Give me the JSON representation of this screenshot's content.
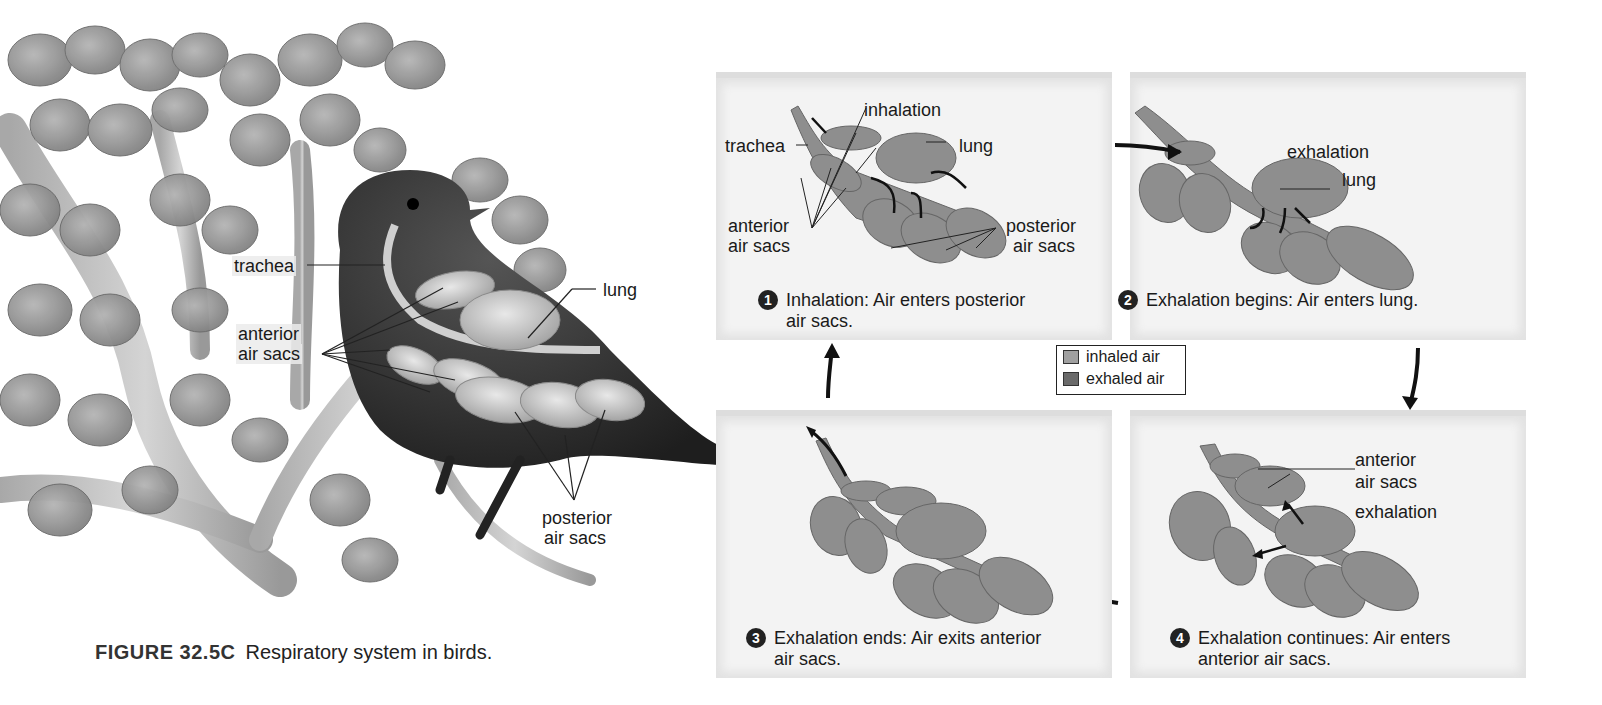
{
  "figure": {
    "number": "FIGURE 32.5C",
    "title": "Respiratory system in birds."
  },
  "bird_illustration": {
    "labels": {
      "trachea": "trachea",
      "lung": "lung",
      "anterior_line1": "anterior",
      "anterior_line2": "air sacs",
      "posterior_line1": "posterior",
      "posterior_line2": "air sacs"
    }
  },
  "legend": {
    "items": [
      {
        "label": "inhaled air",
        "color": "#a0a0a0"
      },
      {
        "label": "exhaled air",
        "color": "#6a6a6a"
      }
    ]
  },
  "panels": [
    {
      "step": "1",
      "caption_line1": "Inhalation: Air enters posterior",
      "caption_line2": "air sacs.",
      "labels": {
        "inhalation": "inhalation",
        "trachea": "trachea",
        "lung": "lung",
        "anterior_line1": "anterior",
        "anterior_line2": "air sacs",
        "posterior_line1": "posterior",
        "posterior_line2": "air sacs"
      }
    },
    {
      "step": "2",
      "caption_line1": "Exhalation begins: Air enters lung.",
      "labels": {
        "exhalation": "exhalation",
        "lung": "lung"
      }
    },
    {
      "step": "3",
      "caption_line1": "Exhalation ends: Air exits anterior",
      "caption_line2": "air sacs."
    },
    {
      "step": "4",
      "caption_line1": "Exhalation continues: Air enters",
      "caption_line2": "anterior air sacs.",
      "labels": {
        "anterior_line1": "anterior",
        "anterior_line2": "air sacs",
        "exhalation": "exhalation"
      }
    }
  ],
  "colors": {
    "panel_bg": "#f3f3f3",
    "organ": "#8e8e8e",
    "bird_body": "#3a3a3a",
    "leaf": "#9a9a9a",
    "branch": "#b8b8b8"
  }
}
